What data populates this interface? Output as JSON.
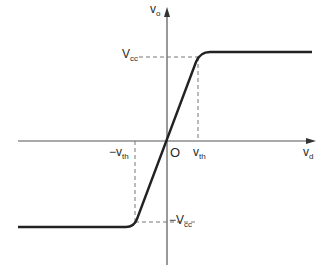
{
  "figure": {
    "type": "transfer-characteristic",
    "axes": {
      "x_label": {
        "main": "v",
        "sub": "d"
      },
      "y_label": {
        "main": "v",
        "sub": "o"
      },
      "origin_label": "O"
    },
    "ticks": {
      "vth": {
        "main": "v",
        "sub": "th"
      },
      "neg_vth": {
        "prefix": "−",
        "main": "v",
        "sub": "th"
      },
      "vcc": {
        "main": "V",
        "sub": "cc"
      },
      "neg_vcc": {
        "prefix": "−",
        "main": "V",
        "sub": "cc"
      }
    },
    "curve": {
      "description": "Saturating linear transfer curve: output clamps at -Vcc for vd < -vth, rises linearly through origin, clamps at +Vcc for vd > vth",
      "color": "#222222"
    },
    "colors": {
      "axis": "#555555",
      "curve": "#222222",
      "dashed": "#777777",
      "background": "#ffffff"
    }
  }
}
